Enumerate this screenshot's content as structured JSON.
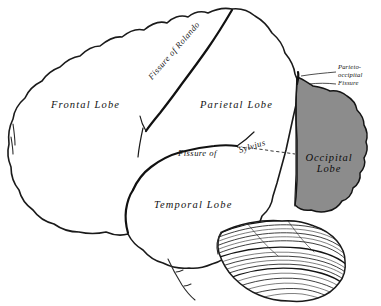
{
  "figure": {
    "background_color": "#ffffff",
    "ink_color": "#1a1a1a",
    "shaded_region_color": "#8c8c8c"
  },
  "labels": {
    "frontal_lobe": "Frontal Lobe",
    "parietal_lobe": "Parietal Lobe",
    "temporal_lobe": "Temporal Lobe",
    "occipital_lobe_line1": "Occipital",
    "occipital_lobe_line2": "Lobe",
    "fissure_of_rolando": "Fissure of Rolando",
    "fissure_of_sylvius_part1": "Fissure  of",
    "fissure_of_sylvius_part2": "Sylvius",
    "parieto_occipital_line1": "Parieto-",
    "parieto_occipital_line2": "occipital",
    "parieto_occipital_line3": "Fissure"
  }
}
